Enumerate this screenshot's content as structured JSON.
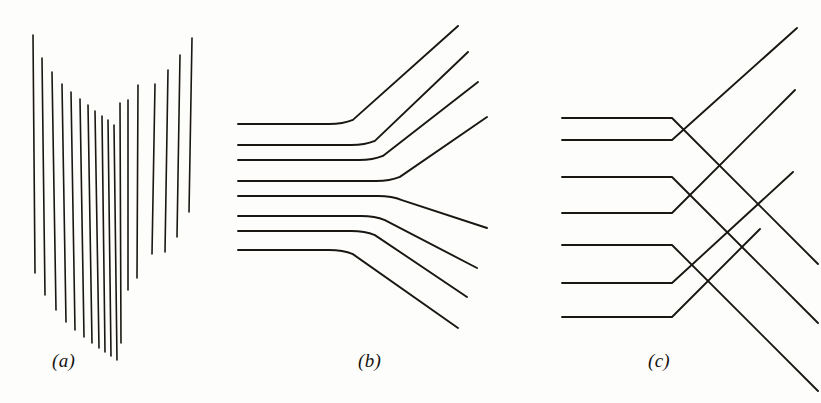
{
  "figure": {
    "background_color": "#fdfdfb",
    "ink_color": "#1a1712",
    "width": 821,
    "height": 403,
    "panel_count": 3
  },
  "labels": [
    {
      "id": "a",
      "text": "(a)",
      "x": 52,
      "y": 350
    },
    {
      "id": "b",
      "text": "(b)",
      "x": 358,
      "y": 350
    },
    {
      "id": "c",
      "text": "(c)",
      "x": 648,
      "y": 350
    }
  ],
  "chart_data": {
    "type": "line",
    "xlabel": "",
    "ylabel": "",
    "xlim": [
      0,
      821
    ],
    "ylim": [
      0,
      403
    ],
    "grid": false,
    "legend": "none",
    "panels": [
      {
        "id": "a",
        "label": "(a)",
        "description": "Array of near-vertical slightly slanted line segments whose endpoints trace a V / chevron envelope",
        "stroke_width": 1.6,
        "segments": [
          {
            "x1": 33,
            "y1": 35,
            "x2": 35,
            "y2": 273
          },
          {
            "x1": 42,
            "y1": 58,
            "x2": 45,
            "y2": 295
          },
          {
            "x1": 52,
            "y1": 72,
            "x2": 56,
            "y2": 310
          },
          {
            "x1": 62,
            "y1": 84,
            "x2": 66,
            "y2": 322
          },
          {
            "x1": 71,
            "y1": 92,
            "x2": 75,
            "y2": 330
          },
          {
            "x1": 80,
            "y1": 99,
            "x2": 84,
            "y2": 337
          },
          {
            "x1": 88,
            "y1": 105,
            "x2": 92,
            "y2": 343
          },
          {
            "x1": 95,
            "y1": 111,
            "x2": 99,
            "y2": 348
          },
          {
            "x1": 102,
            "y1": 116,
            "x2": 105,
            "y2": 352
          },
          {
            "x1": 108,
            "y1": 120,
            "x2": 111,
            "y2": 356
          },
          {
            "x1": 114,
            "y1": 125,
            "x2": 117,
            "y2": 360
          },
          {
            "x1": 120,
            "y1": 103,
            "x2": 121,
            "y2": 343
          },
          {
            "x1": 128,
            "y1": 100,
            "x2": 128,
            "y2": 290
          },
          {
            "x1": 138,
            "y1": 85,
            "x2": 137,
            "y2": 278
          },
          {
            "x1": 155,
            "y1": 84,
            "x2": 152,
            "y2": 254
          },
          {
            "x1": 168,
            "y1": 70,
            "x2": 165,
            "y2": 252
          },
          {
            "x1": 180,
            "y1": 55,
            "x2": 177,
            "y2": 237
          },
          {
            "x1": 192,
            "y1": 38,
            "x2": 189,
            "y2": 212
          }
        ]
      },
      {
        "id": "b",
        "label": "(b)",
        "description": "Eight horizontal lines entering from the left that bend smoothly into 45-degree diagonals; the top four sweep up-right and the bottom four sweep down-right, crossing each other",
        "stroke_width": 1.9,
        "bend_radius": 14,
        "entry_x": 238,
        "rays": [
          {
            "index": 1,
            "y": 124,
            "bend_x": 343,
            "direction": "up",
            "end_x": 458,
            "end_y": 26
          },
          {
            "index": 2,
            "y": 145,
            "bend_x": 365,
            "direction": "up",
            "end_x": 468,
            "end_y": 52
          },
          {
            "index": 3,
            "y": 160,
            "bend_x": 373,
            "direction": "up",
            "end_x": 478,
            "end_y": 82
          },
          {
            "index": 4,
            "y": 181,
            "bend_x": 390,
            "direction": "up",
            "end_x": 487,
            "end_y": 117
          },
          {
            "index": 5,
            "y": 196,
            "bend_x": 392,
            "direction": "down",
            "end_x": 487,
            "end_y": 228
          },
          {
            "index": 6,
            "y": 216,
            "bend_x": 375,
            "direction": "down",
            "end_x": 477,
            "end_y": 268
          },
          {
            "index": 7,
            "y": 231,
            "bend_x": 365,
            "direction": "down",
            "end_x": 467,
            "end_y": 297
          },
          {
            "index": 8,
            "y": 250,
            "bend_x": 343,
            "direction": "down",
            "end_x": 458,
            "end_y": 328
          }
        ]
      },
      {
        "id": "c",
        "label": "(c)",
        "description": "Seven horizontal lines entering from the left that terminate at a common vertical front and turn sharply through 45 degrees, forming chevron/diamond junctions; outgoing diagonals cross on the right",
        "stroke_width": 1.9,
        "entry_x": 562,
        "front_x": 672,
        "rays": [
          {
            "index": 1,
            "y": 118,
            "direction": "down",
            "end_x": 818,
            "end_y": 264
          },
          {
            "index": 2,
            "y": 140,
            "direction": "up",
            "end_x": 797,
            "end_y": 28
          },
          {
            "index": 3,
            "y": 177,
            "direction": "down",
            "end_x": 818,
            "end_y": 323
          },
          {
            "index": 4,
            "y": 213,
            "direction": "up",
            "end_x": 795,
            "end_y": 90
          },
          {
            "index": 5,
            "y": 245,
            "direction": "down",
            "end_x": 818,
            "end_y": 391
          },
          {
            "index": 6,
            "y": 283,
            "direction": "up",
            "end_x": 793,
            "end_y": 172
          },
          {
            "index": 7,
            "y": 317,
            "direction": "up",
            "end_x": 760,
            "end_y": 229
          }
        ]
      }
    ]
  }
}
